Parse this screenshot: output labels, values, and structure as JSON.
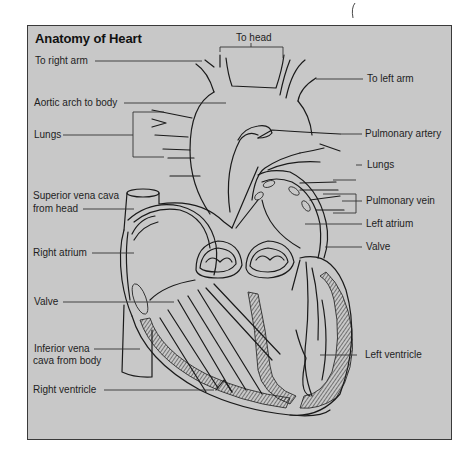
{
  "figure": {
    "title": "Anatomy of Heart",
    "background_color": "#c8c8c8",
    "border_color": "#3a3a3a",
    "line_color": "#1a1a1a"
  },
  "labels": {
    "left": [
      {
        "id": "to-right-arm",
        "text": "To right arm"
      },
      {
        "id": "aortic-arch",
        "text": "Aortic arch to body"
      },
      {
        "id": "lungs-left",
        "text": "Lungs"
      },
      {
        "id": "superior-vena-cava-1",
        "text": "Superior vena cava"
      },
      {
        "id": "superior-vena-cava-2",
        "text": "from head"
      },
      {
        "id": "right-atrium",
        "text": "Right atrium"
      },
      {
        "id": "valve-left",
        "text": "Valve"
      },
      {
        "id": "inferior-vena-cava-1",
        "text": "Inferior vena"
      },
      {
        "id": "inferior-vena-cava-2",
        "text": "cava from body"
      },
      {
        "id": "right-ventricle",
        "text": "Right ventricle"
      }
    ],
    "top": [
      {
        "id": "to-head",
        "text": "To head"
      }
    ],
    "right": [
      {
        "id": "to-left-arm",
        "text": "To left arm"
      },
      {
        "id": "pulmonary-artery",
        "text": "Pulmonary artery"
      },
      {
        "id": "lungs-right",
        "text": "Lungs"
      },
      {
        "id": "pulmonary-vein",
        "text": "Pulmonary vein"
      },
      {
        "id": "left-atrium",
        "text": "Left atrium"
      },
      {
        "id": "valve-right",
        "text": "Valve"
      },
      {
        "id": "left-ventricle",
        "text": "Left ventricle"
      }
    ]
  }
}
